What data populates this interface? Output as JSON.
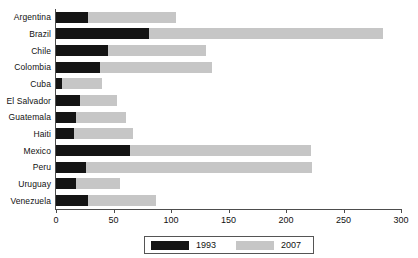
{
  "chart_data": {
    "type": "bar",
    "orientation": "horizontal",
    "title": "",
    "subtitle": "",
    "xlabel": "",
    "ylabel": "",
    "xlim": [
      0,
      310
    ],
    "ylim": null,
    "grid": false,
    "legend_position": "bottom",
    "categories": [
      "Argentina",
      "Brazil",
      "Chile",
      "Colombia",
      "Cuba",
      "El Salvador",
      "Guatemala",
      "Haiti",
      "Mexico",
      "Peru",
      "Uruguay",
      "Venezuela"
    ],
    "series": [
      {
        "name": "1993",
        "color": "#141414",
        "values": [
          28,
          81,
          45,
          38,
          5,
          21,
          17,
          16,
          64,
          26,
          17,
          28
        ]
      },
      {
        "name": "2007",
        "color": "#c6c6c6",
        "values": [
          104,
          284,
          130,
          136,
          40,
          53,
          61,
          67,
          222,
          223,
          56,
          87
        ]
      }
    ],
    "x_ticks": [
      0,
      50,
      100,
      150,
      200,
      250,
      300
    ],
    "x_tick_labels": [
      "0",
      "50",
      "100",
      "150",
      "200",
      "250",
      "300"
    ]
  },
  "legend": {
    "entries": [
      {
        "label": "1993",
        "color": "#141414"
      },
      {
        "label": "2007",
        "color": "#c6c6c6"
      }
    ]
  },
  "axes": {
    "axis_color": "#4d4d4d"
  }
}
